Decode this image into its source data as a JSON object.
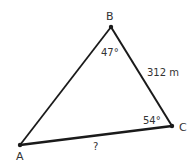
{
  "diagram": {
    "type": "triangle",
    "vertices": {
      "A": {
        "label": "A",
        "x": 20,
        "y": 145
      },
      "B": {
        "label": "B",
        "x": 111,
        "y": 27
      },
      "C": {
        "label": "C",
        "x": 172,
        "y": 126
      }
    },
    "angles": {
      "B": "47°",
      "C": "54°"
    },
    "sides": {
      "BC": "312 m",
      "AC": "?"
    },
    "colors": {
      "stroke": "#1a1a1a",
      "text": "#333333",
      "background": "#ffffff"
    }
  }
}
